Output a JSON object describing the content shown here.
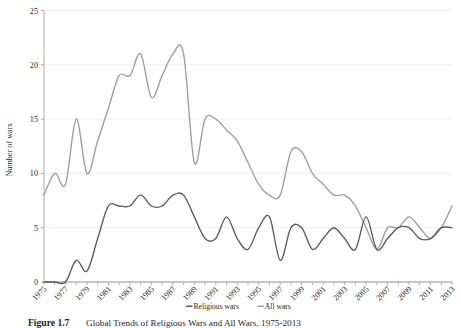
{
  "figure": {
    "caption_bold": "Figure 1.7",
    "caption_rest": "Global Trends of Religious Wars and All Wars, 1975-2013"
  },
  "legend": {
    "position": "bottom-center",
    "items": [
      {
        "label": "Religious wars",
        "color": "#595959"
      },
      {
        "label": "All wars",
        "color": "#9d9d9d"
      }
    ]
  },
  "axes": {
    "ylabel": "Number of wars",
    "yticks": [
      "0",
      "5",
      "10",
      "15",
      "20",
      "25"
    ],
    "xticks_labeled": [
      "1975",
      "1977",
      "1979",
      "1981",
      "1983",
      "1985",
      "1987",
      "1989",
      "1991",
      "1993",
      "1995",
      "1997",
      "1999",
      "2001",
      "2003",
      "2005",
      "2007",
      "2009",
      "2011",
      "2013"
    ]
  },
  "chart_data": {
    "type": "line",
    "title": "Global Trends of Religious Wars and All Wars, 1975-2013",
    "xlabel": "",
    "ylabel": "Number of wars",
    "xlim": [
      1975,
      2013
    ],
    "ylim": [
      0,
      25
    ],
    "grid": "horizontal",
    "legend_position": "bottom-center",
    "x": [
      1975,
      1976,
      1977,
      1978,
      1979,
      1980,
      1981,
      1982,
      1983,
      1984,
      1985,
      1986,
      1987,
      1988,
      1989,
      1990,
      1991,
      1992,
      1993,
      1994,
      1995,
      1996,
      1997,
      1998,
      1999,
      2000,
      2001,
      2002,
      2003,
      2004,
      2005,
      2006,
      2007,
      2008,
      2009,
      2010,
      2011,
      2012,
      2013
    ],
    "series": [
      {
        "name": "All wars",
        "color": "#9d9d9d",
        "values": [
          8,
          10,
          9,
          15,
          10,
          13,
          16,
          19,
          19,
          21,
          17,
          19,
          21,
          21,
          11,
          15,
          15,
          14,
          13,
          11,
          9,
          8,
          8,
          12,
          12,
          10,
          9,
          8,
          8,
          7,
          5,
          3,
          5,
          5,
          6,
          5,
          4,
          5,
          7
        ]
      },
      {
        "name": "Religious wars",
        "color": "#595959",
        "values": [
          0,
          0,
          0,
          2,
          1,
          4,
          7,
          7,
          7,
          8,
          7,
          7,
          8,
          8,
          6,
          4,
          4,
          6,
          4,
          3,
          5,
          6,
          2,
          5,
          5,
          3,
          4,
          5,
          4,
          3,
          6,
          3,
          4,
          5,
          5,
          4,
          4,
          5,
          5
        ]
      }
    ]
  }
}
